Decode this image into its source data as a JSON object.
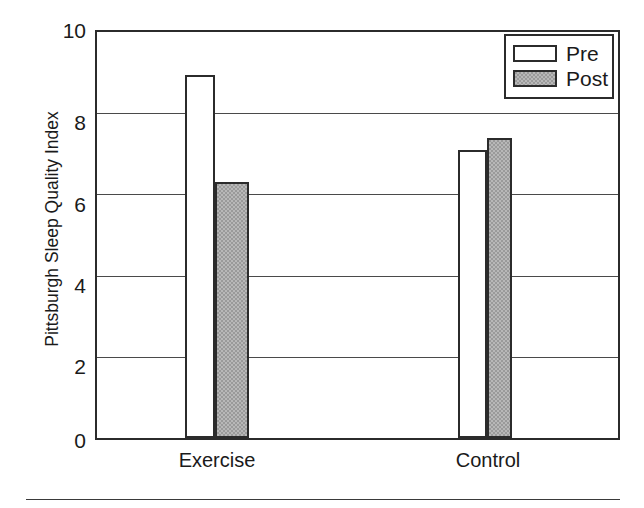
{
  "chart_data": {
    "type": "bar",
    "title": "",
    "xlabel": "",
    "ylabel": "Pittsburgh Sleep Quality Index",
    "categories": [
      "Exercise",
      "Control"
    ],
    "series": [
      {
        "name": "Pre",
        "values": [
          8.95,
          7.1
        ],
        "fill": "#ffffff",
        "edge": "#2b2b2b"
      },
      {
        "name": "Post",
        "values": [
          6.3,
          7.4
        ],
        "fill": "#9a9a9a",
        "edge": "#2b2b2b"
      }
    ],
    "ylim": [
      0,
      10
    ],
    "yticks": [
      0,
      2,
      4,
      6,
      8,
      10
    ],
    "ytick_labels": [
      "0",
      "2",
      "4",
      "6",
      "8",
      "10"
    ],
    "gridlines_y": [
      2,
      4,
      6,
      8
    ],
    "grid": true,
    "legend": {
      "position": "top-right-inside",
      "entries": [
        "Pre",
        "Post"
      ]
    }
  },
  "axis": {
    "y_label": "Pittsburgh Sleep Quality Index",
    "y_ticks": [
      "10",
      "8",
      "6",
      "4",
      "2",
      "0"
    ],
    "x_ticks": [
      "Exercise",
      "Control"
    ]
  },
  "legend": {
    "pre_label": "Pre",
    "post_label": "Post"
  },
  "colors": {
    "frame": "#2b2b2b",
    "grid": "#4a4a4a",
    "post_fill": "#9a9a9a",
    "pre_fill": "#ffffff",
    "text": "#1a1a1a",
    "background": "#ffffff"
  }
}
